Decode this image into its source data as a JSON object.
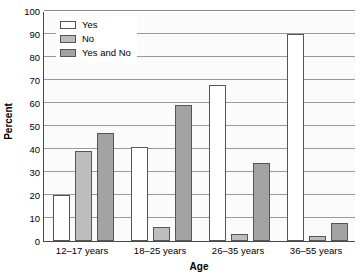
{
  "chart_data": {
    "type": "bar",
    "title": "",
    "xlabel": "Age",
    "ylabel": "Percent",
    "categories": [
      "12–17 years",
      "18–25 years",
      "26–35 years",
      "36–55 years"
    ],
    "series": [
      {
        "name": "Yes",
        "values": [
          20,
          41,
          68,
          90
        ],
        "color": "#ffffff"
      },
      {
        "name": "No",
        "values": [
          39,
          6,
          3,
          2
        ],
        "color": "#bdbdbd"
      },
      {
        "name": "Yes and No",
        "values": [
          47,
          59,
          34,
          8
        ],
        "color": "#a3a3a3"
      }
    ],
    "ylim": [
      0,
      100
    ],
    "yticks": [
      0,
      10,
      20,
      30,
      40,
      50,
      60,
      70,
      80,
      90,
      100
    ],
    "ytick_labels": [
      "0",
      "10",
      "20",
      "30",
      "40",
      "50",
      "60",
      "70",
      "80",
      "90",
      "100"
    ],
    "grid": true,
    "grid_axis": "y",
    "legend_position": "upper-left-inside",
    "legend_entries": [
      "Yes",
      "No",
      "Yes and No"
    ],
    "bar_edge_color": "#555555",
    "axis_color": "#4a4a4a",
    "gridline_color": "#9a9a9a",
    "plot_background": "#fbfbfb"
  }
}
